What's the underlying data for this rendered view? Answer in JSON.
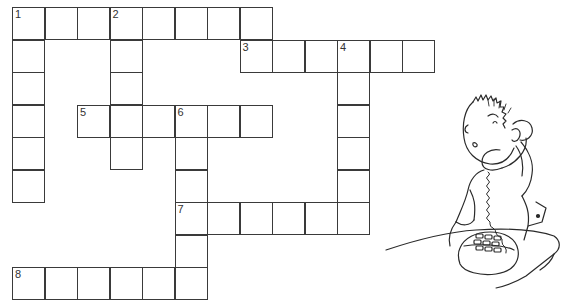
{
  "puzzle": {
    "type": "crossword",
    "grid_rows": 9,
    "grid_cols": 13,
    "cell_size_px": 32.5,
    "origin_px": [
      12,
      7
    ],
    "clue_numbers": [
      "1",
      "2",
      "3",
      "4",
      "5",
      "6",
      "7",
      "8"
    ],
    "words": [
      {
        "number": "1",
        "direction": "across",
        "row": 0,
        "col": 0,
        "length": 8
      },
      {
        "number": "1",
        "direction": "down",
        "row": 0,
        "col": 0,
        "length": 6
      },
      {
        "number": "2",
        "direction": "down",
        "row": 0,
        "col": 3,
        "length": 5
      },
      {
        "number": "3",
        "direction": "across",
        "row": 1,
        "col": 7,
        "length": 6
      },
      {
        "number": "4",
        "direction": "down",
        "row": 1,
        "col": 10,
        "length": 6
      },
      {
        "number": "5",
        "direction": "across",
        "row": 3,
        "col": 2,
        "length": 6
      },
      {
        "number": "6",
        "direction": "down",
        "row": 3,
        "col": 5,
        "length": 6
      },
      {
        "number": "7",
        "direction": "across",
        "row": 6,
        "col": 5,
        "length": 6
      },
      {
        "number": "8",
        "direction": "across",
        "row": 8,
        "col": 0,
        "length": 6
      }
    ]
  },
  "illustration": {
    "subject": "boy-on-telephone",
    "description": "Line drawing of a boy with spiky hair holding a corded telephone receiver to his ear, looking up, with the phone base on a table"
  },
  "colors": {
    "line": "#3a3a3a",
    "background": "#ffffff"
  }
}
